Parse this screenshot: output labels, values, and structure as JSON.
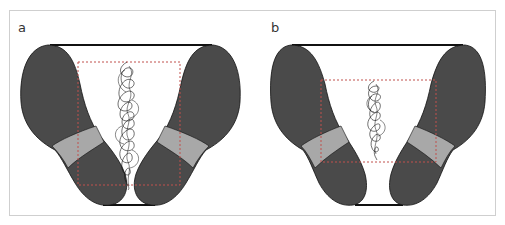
{
  "figure": {
    "panels": [
      {
        "label": "a",
        "description": "Foot positions wide stance at top, toes converging at bottom; center-of-pressure trace with dashed bounding box (larger sway area)"
      },
      {
        "label": "b",
        "description": "Same foot outline; center-of-pressure trace smaller with smaller dashed bounding box"
      }
    ],
    "colors": {
      "foot_dark": "#4a4a4a",
      "foot_band": "#a8a8a8",
      "outline": "#111111",
      "dashed_box": "#c0504d",
      "trace": "#111111",
      "frame_border": "#cfcfcf"
    }
  }
}
